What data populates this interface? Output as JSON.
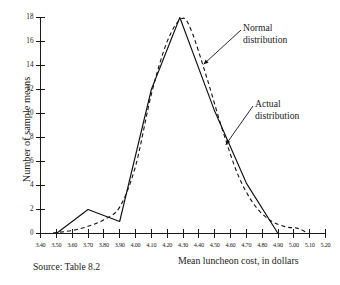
{
  "figure": {
    "source_note": "Source:  Table 8.2"
  },
  "chart_data": {
    "type": "line",
    "title": "",
    "subtitle": "",
    "xlabel": "Mean luncheon cost, in dollars",
    "ylabel": "Number of sample means",
    "xlim": [
      3.4,
      5.2
    ],
    "ylim": [
      0,
      18
    ],
    "xticks": [
      3.4,
      3.5,
      3.6,
      3.7,
      3.8,
      3.9,
      4.0,
      4.1,
      4.2,
      4.3,
      4.4,
      4.5,
      4.6,
      4.7,
      4.8,
      4.9,
      5.0,
      5.1,
      5.2
    ],
    "xtick_labels": [
      "3.40",
      "3.50",
      "3.60",
      "3.70",
      "3.80",
      "3.90",
      "4.00",
      "4.10",
      "4.20",
      "4.30",
      "4.40",
      "4.50",
      "4.60",
      "4.70",
      "4.80",
      "4.90",
      "5.00",
      "5.10",
      "5.20"
    ],
    "yticks": [
      0,
      2,
      4,
      6,
      8,
      10,
      12,
      14,
      16,
      18
    ],
    "ytick_labels": [
      "0",
      "2",
      "4",
      "6",
      "8",
      "10",
      "12",
      "14",
      "16",
      "18"
    ],
    "grid": false,
    "legend_position": "annotations",
    "series": [
      {
        "name": "Actual distribution",
        "style": "solid",
        "color": "#111111",
        "points": [
          [
            3.5,
            0.0
          ],
          [
            3.7,
            2.0
          ],
          [
            3.9,
            1.0
          ],
          [
            4.1,
            12.0
          ],
          [
            4.28,
            18.0
          ],
          [
            4.5,
            10.2
          ],
          [
            4.7,
            4.2
          ],
          [
            4.9,
            0.0
          ]
        ]
      },
      {
        "name": "Normal distribution",
        "style": "dashed",
        "color": "#111111",
        "points": [
          [
            3.48,
            0.05
          ],
          [
            3.6,
            0.25
          ],
          [
            3.7,
            0.6
          ],
          [
            3.8,
            1.15
          ],
          [
            3.9,
            2.2
          ],
          [
            4.0,
            5.6
          ],
          [
            4.1,
            11.6
          ],
          [
            4.2,
            16.0
          ],
          [
            4.29,
            17.9
          ],
          [
            4.35,
            17.0
          ],
          [
            4.45,
            13.0
          ],
          [
            4.55,
            8.6
          ],
          [
            4.65,
            4.8
          ],
          [
            4.75,
            2.4
          ],
          [
            4.85,
            1.1
          ],
          [
            4.95,
            0.55
          ],
          [
            5.02,
            0.45
          ],
          [
            5.08,
            0.1
          ]
        ]
      }
    ],
    "annotations": [
      {
        "name": "normal-distribution-callout",
        "text_line1": "Normal",
        "text_line2": "distribution",
        "points_to": [
          4.43,
          14.1
        ]
      },
      {
        "name": "actual-distribution-callout",
        "text_line1": "Actual",
        "text_line2": "distribution",
        "points_to": [
          4.57,
          7.4
        ]
      }
    ]
  }
}
